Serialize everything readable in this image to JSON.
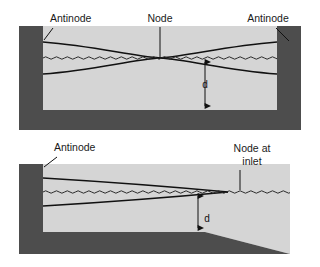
{
  "figure": {
    "width": 320,
    "height": 267,
    "background": "#ffffff",
    "colors": {
      "wall": "#4d4d4d",
      "water": "#d5d5d5",
      "bed": "#4d4d4d",
      "curve": "#111111",
      "surface": "#2a2a2a",
      "label_text": "#1a1a1a",
      "page_background": "#ffffff"
    }
  },
  "panels": [
    {
      "id": "closed-basin",
      "name": "closed-basin-panel",
      "labels": [
        {
          "id": "antinode-left",
          "text": "Antinode",
          "x": 50,
          "y": 22,
          "anchor": "start"
        },
        {
          "id": "node-center",
          "text": "Node",
          "x": 160,
          "y": 22,
          "anchor": "middle"
        },
        {
          "id": "antinode-right",
          "text": "Antinode",
          "x": 268,
          "y": 22,
          "anchor": "middle"
        },
        {
          "id": "depth-d",
          "text": "d",
          "x": 205,
          "y": 94,
          "anchor": "middle"
        }
      ],
      "geometry": {
        "left_wall_x": 19,
        "left_wall_inner_x": 43,
        "right_wall_inner_x": 277,
        "right_wall_x": 301,
        "wall_top_y": 26,
        "water_surface_y": 58,
        "bed_top_y": 110,
        "bed_bottom_y": 130,
        "antinode_amplitude_y": 16,
        "node_x": 160
      }
    },
    {
      "id": "open-inlet-basin",
      "name": "open-inlet-basin-panel",
      "labels": [
        {
          "id": "antinode-left",
          "text": "Antinode",
          "x": 54,
          "y": 151,
          "anchor": "start"
        },
        {
          "id": "node-at-inlet-line1",
          "text": "Node at",
          "x": 252,
          "y": 152,
          "anchor": "middle"
        },
        {
          "id": "node-at-inlet-line2",
          "text": "inlet",
          "x": 252,
          "y": 165,
          "anchor": "middle"
        },
        {
          "id": "depth-d",
          "text": "d",
          "x": 198,
          "y": 228,
          "anchor": "middle"
        }
      ],
      "geometry": {
        "left_wall_x": 19,
        "left_wall_inner_x": 43,
        "wall_top_y": 164,
        "water_surface_y": 192,
        "bed_top_y": 232,
        "bed_bottom_y": 254,
        "slope_start_x": 205,
        "slope_end_x": 290,
        "node_x": 228,
        "antinode_amplitude_y": 14
      }
    }
  ],
  "annotations": {
    "leader_lines": [
      {
        "id": "antinode-left-leader-top",
        "from": [
          53,
          28
        ],
        "to": [
          44,
          40
        ]
      },
      {
        "id": "node-leader",
        "from": [
          160,
          27
        ],
        "to": [
          160,
          57
        ]
      },
      {
        "id": "antinode-right-leader",
        "from": [
          276,
          28
        ],
        "to": [
          289,
          41
        ]
      },
      {
        "id": "antinode-left-leader-bottom",
        "from": [
          57,
          157
        ],
        "to": [
          44,
          167
        ]
      },
      {
        "id": "node-inlet-leader",
        "from": [
          240,
          170
        ],
        "to": [
          240,
          190
        ]
      }
    ],
    "dimension_arrows": [
      {
        "id": "d-arrow-top",
        "x": 205,
        "y_top": 58,
        "y_bottom": 110
      },
      {
        "id": "d-arrow-bottom",
        "x": 198,
        "y_top": 192,
        "y_bottom": 232
      }
    ]
  }
}
